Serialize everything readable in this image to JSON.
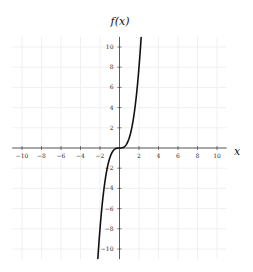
{
  "chart_data": {
    "type": "line",
    "title": "f(x)",
    "xlabel": "x",
    "ylabel": "f(x)",
    "xlim": [
      -11,
      11
    ],
    "ylim": [
      -11,
      11
    ],
    "grid": true,
    "legend": null,
    "x_ticks": [
      -10,
      -8,
      -6,
      -4,
      -2,
      2,
      4,
      6,
      8,
      10
    ],
    "y_ticks": [
      -10,
      -8,
      -6,
      -4,
      -2,
      2,
      4,
      6,
      8,
      10
    ],
    "x_tick_labels": [
      "−10",
      "−8",
      "−6",
      "−4",
      "−2",
      "2",
      "4",
      "6",
      "8",
      "10"
    ],
    "y_tick_labels": [
      "−10",
      "−8",
      "−6",
      "−4",
      "−2",
      "2",
      "4",
      "6",
      "8",
      "10"
    ],
    "series": [
      {
        "name": "f(x) = x^3",
        "x": [
          -2.22,
          -2.0,
          -1.8,
          -1.6,
          -1.4,
          -1.2,
          -1.0,
          -0.8,
          -0.6,
          -0.4,
          -0.2,
          0.0,
          0.2,
          0.4,
          0.6,
          0.8,
          1.0,
          1.2,
          1.4,
          1.6,
          1.8,
          2.0,
          2.22
        ],
        "values": [
          -10.94,
          -8.0,
          -5.83,
          -4.1,
          -2.74,
          -1.73,
          -1.0,
          -0.51,
          -0.22,
          -0.06,
          -0.01,
          0.0,
          0.01,
          0.06,
          0.22,
          0.51,
          1.0,
          1.73,
          2.74,
          4.1,
          5.83,
          8.0,
          10.94
        ],
        "color": "#111111"
      }
    ]
  },
  "colors": {
    "curve": "#111111",
    "axis": "#333333",
    "grid": "#f0f0f0"
  }
}
